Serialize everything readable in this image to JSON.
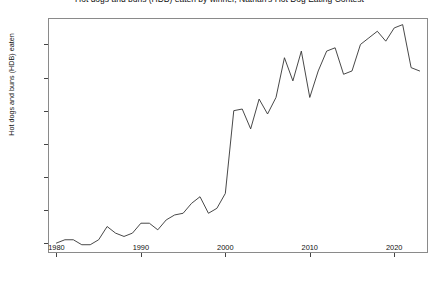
{
  "chart_data": {
    "type": "line",
    "title": "Hot dogs and buns (HDB) eaten by winner, Nathan's Hot Dog Eating Contest",
    "xlabel": "",
    "ylabel": "Hot dogs and buns (HDB) eaten",
    "xlim": [
      1979,
      2024
    ],
    "ylim": [
      7,
      78
    ],
    "xticks": [
      1980,
      1990,
      2000,
      2010,
      2020
    ],
    "yticks": [
      10,
      20,
      30,
      40,
      50,
      60,
      70
    ],
    "grid": false,
    "legend": null,
    "line_color": "#333333",
    "series": [
      {
        "name": "HDB eaten",
        "x": [
          1980,
          1981,
          1982,
          1983,
          1984,
          1985,
          1986,
          1987,
          1988,
          1989,
          1990,
          1991,
          1992,
          1993,
          1994,
          1995,
          1996,
          1997,
          1998,
          1999,
          2000,
          2001,
          2002,
          2003,
          2004,
          2005,
          2006,
          2007,
          2008,
          2009,
          2010,
          2011,
          2012,
          2013,
          2014,
          2015,
          2016,
          2017,
          2018,
          2019,
          2020,
          2021,
          2022,
          2023
        ],
        "values": [
          10,
          11,
          11,
          9.5,
          9.5,
          11,
          15,
          13,
          12,
          13,
          16,
          16,
          14,
          17,
          18.5,
          19,
          22,
          24,
          19,
          20.5,
          25,
          50,
          50.5,
          44.5,
          53.5,
          49,
          54,
          66,
          59,
          68,
          54,
          62,
          68,
          69,
          61,
          62,
          70,
          72,
          74,
          71,
          75,
          76,
          63,
          62
        ]
      }
    ]
  }
}
